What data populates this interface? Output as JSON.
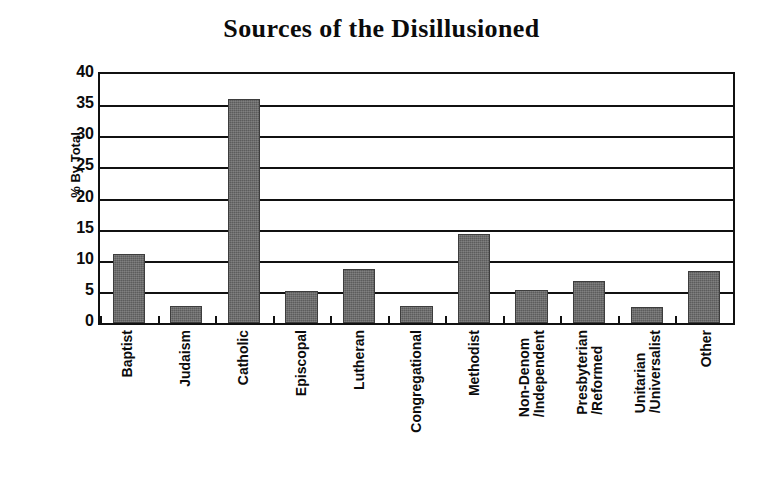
{
  "chart_data": {
    "type": "bar",
    "title": "Sources of the Disillusioned",
    "xlabel": "",
    "ylabel": "% By Total",
    "ylim": [
      0,
      40
    ],
    "ytick_step": 5,
    "yticks": [
      40,
      35,
      30,
      25,
      20,
      15,
      10,
      5,
      0
    ],
    "grid": true,
    "legend": false,
    "bar_color": "#5c5c5c",
    "axis_color": "#111111",
    "background": "#ffffff",
    "categories": [
      "Baptist",
      "Judaism",
      "Catholic",
      "Episcopal",
      "Lutheran",
      "Congregational",
      "Methodist",
      "Non-Denom /Independent",
      "Presbyterian /Reformed",
      "Unitarian /Universalist",
      "Other"
    ],
    "category_lines": [
      [
        "Baptist"
      ],
      [
        "Judaism"
      ],
      [
        "Catholic"
      ],
      [
        "Episcopal"
      ],
      [
        "Lutheran"
      ],
      [
        "Congregational"
      ],
      [
        "Methodist"
      ],
      [
        "Non-Denom",
        "/Independent"
      ],
      [
        "Presbyterian",
        "/Reformed"
      ],
      [
        "Unitarian",
        "/Universalist"
      ],
      [
        "Other"
      ]
    ],
    "values": [
      11.1,
      2.7,
      36.0,
      5.2,
      8.7,
      2.8,
      14.3,
      5.3,
      6.7,
      2.5,
      8.4
    ]
  }
}
